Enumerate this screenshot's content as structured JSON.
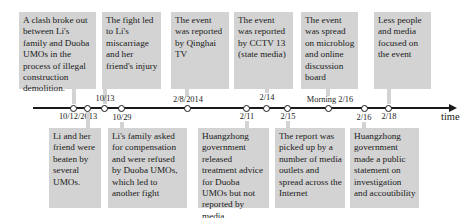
{
  "timeline": {
    "axis_label": "time",
    "top_events": [
      {
        "text": "A clash broke out between Li's family and Duoba UMOs in the process of illegal construction demolition."
      },
      {
        "text": "The fight led to Li's miscarriage and her friend's injury"
      },
      {
        "text": "The event was reported by Qinghai TV"
      },
      {
        "text": "The event was reported by CCTV 13 (state media)"
      },
      {
        "text": "The event was spread on microblog and online discussion board"
      },
      {
        "text": "Less people and media focused on the event"
      }
    ],
    "bottom_events": [
      {
        "text": "Li and her friend were beaten by several UMOs."
      },
      {
        "text": "Li's family asked for compensation and were refused by Duoba UMOs, which led to another fight"
      },
      {
        "text": "Huangzhong government released treatment advice for Duoba UMOs but not reported by media"
      },
      {
        "text": "The report was picked up by a number of media outlets and spread across the Internet"
      },
      {
        "text": "Huangzhong government made a public statement on investigation and accoutibility"
      }
    ],
    "dates_above": [
      "10/13",
      "2/8/2014",
      "2/14",
      "Morning 2/16"
    ],
    "dates_below": [
      "10/12/2013",
      "10/29",
      "2/11",
      "2/15",
      "2/16",
      "2/18"
    ],
    "colors": {
      "box": "#d3d3d3",
      "line": "#1a1a1a"
    }
  }
}
